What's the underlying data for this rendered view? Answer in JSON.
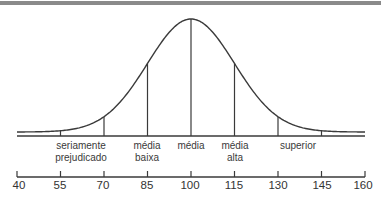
{
  "chart_data": {
    "type": "line",
    "title": "",
    "xlabel": "",
    "ylabel": "",
    "x_ticks": [
      40,
      55,
      70,
      85,
      100,
      115,
      130,
      145,
      160
    ],
    "xlim": [
      40,
      160
    ],
    "mean": 100,
    "sd": 15,
    "vertical_markers": [
      55,
      70,
      85,
      100,
      115,
      130,
      145
    ],
    "categories": [
      {
        "label": "seriamente prejudicado",
        "range": [
          55,
          70
        ]
      },
      {
        "label": "média baixa",
        "range": [
          70,
          85
        ]
      },
      {
        "label": "média",
        "range": [
          85,
          115
        ]
      },
      {
        "label": "média alta",
        "range": [
          115,
          130
        ]
      },
      {
        "label": "superior",
        "range": [
          130,
          145
        ]
      }
    ],
    "grid": false,
    "legend": null
  },
  "labels": {
    "severe_1": "seriamente",
    "severe_2": "prejudicado",
    "low_avg_1": "média",
    "low_avg_2": "baixa",
    "avg": "média",
    "high_avg_1": "média",
    "high_avg_2": "alta",
    "superior": "superior"
  },
  "ticks": [
    "40",
    "55",
    "70",
    "85",
    "100",
    "115",
    "130",
    "145",
    "160"
  ]
}
